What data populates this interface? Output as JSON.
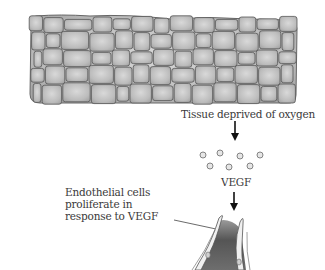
{
  "diagram": {
    "tissue_label": "Tissue deprived of oxygen",
    "vegf_label": "VEGF",
    "endothelial_label_lines": [
      "Endothelial cells",
      "proliferate in",
      "response to VEGF"
    ],
    "colors": {
      "cell_fill": "#bdbdbd",
      "cell_border": "#555555",
      "vessel_lumen": "#6a6a6a",
      "arrow": "#111111"
    }
  }
}
